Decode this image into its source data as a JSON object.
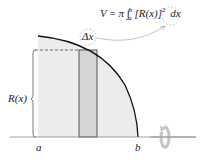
{
  "diagram": {
    "formula": {
      "lhs": "V",
      "equals": "=",
      "pi": "π",
      "integral": "∫",
      "lower": "a",
      "upper": "b",
      "integrand": "[R(x)]",
      "power": "2",
      "differential": "dx"
    },
    "labels": {
      "delta_x": "Δx",
      "radius": "R(x)",
      "a": "a",
      "b": "b"
    },
    "colors": {
      "region_fill": "#ececec",
      "strip_fill": "#d6d6d6",
      "curve": "#111111",
      "axis": "#888888",
      "arrow": "#999999",
      "rotation_icon": "#bbbbbb"
    },
    "icons": {
      "rotation": "rotation-arrow-icon"
    }
  }
}
